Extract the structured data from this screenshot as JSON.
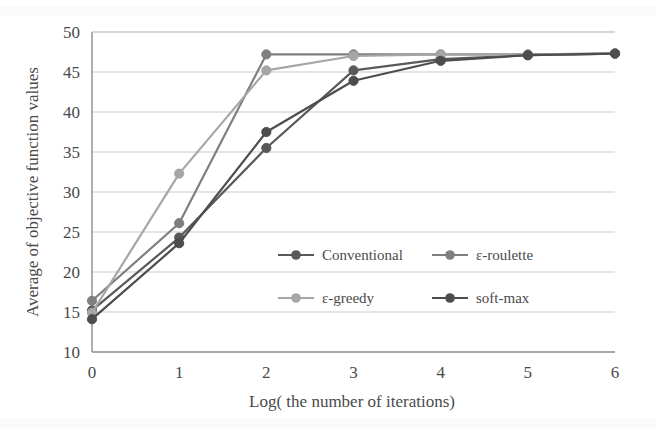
{
  "chart_data": {
    "type": "line",
    "title": "",
    "subtitle": "",
    "xlabel": "Log( the number of iterations)",
    "ylabel": "Average of objective function values",
    "x": [
      0,
      1,
      2,
      3,
      4,
      5,
      6
    ],
    "xlim": [
      0,
      6
    ],
    "ylim": [
      10,
      50
    ],
    "xticks": [
      "0",
      "1",
      "2",
      "3",
      "4",
      "5",
      "6"
    ],
    "yticks": [
      "10",
      "15",
      "20",
      "25",
      "30",
      "35",
      "40",
      "45",
      "50"
    ],
    "grid": "horizontal",
    "legend_position": "inside-center",
    "series": [
      {
        "name": "Conventional",
        "color": "#595959",
        "values": [
          15.2,
          24.3,
          35.5,
          45.2,
          46.6,
          47.1,
          47.3
        ]
      },
      {
        "name": "ε-roulette",
        "color": "#7f7f7f",
        "values": [
          16.4,
          26.1,
          47.2,
          47.2,
          47.2,
          47.2,
          47.3
        ]
      },
      {
        "name": "ε-greedy",
        "color": "#a6a6a6",
        "values": [
          14.9,
          32.3,
          45.2,
          47.0,
          47.2,
          47.2,
          47.3
        ]
      },
      {
        "name": "soft-max",
        "color": "#4d4d4d",
        "values": [
          14.1,
          23.6,
          37.5,
          43.9,
          46.4,
          47.1,
          47.3
        ]
      }
    ]
  },
  "axes": {
    "x_title": "Log( the number of iterations)",
    "y_title": "Average of objective function values"
  },
  "legend": {
    "entries": [
      {
        "label": "Conventional",
        "color": "#595959"
      },
      {
        "label": "ε-roulette",
        "color": "#7f7f7f"
      },
      {
        "label": "ε-greedy",
        "color": "#a6a6a6"
      },
      {
        "label": "soft-max",
        "color": "#4d4d4d"
      }
    ]
  },
  "style": {
    "plot_background": "#ffffff",
    "grid_color": "#c9c9c9",
    "axis_color": "#8c8c8c",
    "text_color": "#4a4a4a"
  }
}
